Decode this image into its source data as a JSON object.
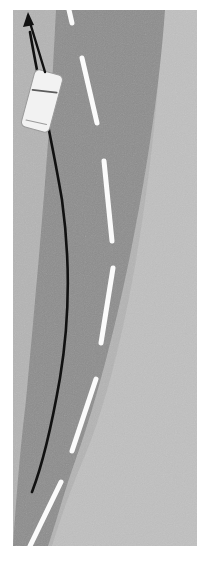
{
  "figure": {
    "name": "overhead-road-scene",
    "canvas": {
      "width": 202,
      "height": 574
    },
    "image_area": {
      "x": 13,
      "y": 10,
      "width": 184,
      "height": 536
    }
  },
  "colors": {
    "page_background": "#ffffff",
    "road_asphalt": "#8d8d8d",
    "shoulder_left": "#b4b4b4",
    "shoulder_right": "#c0c0c0",
    "lane_marking": "#fbfbfb",
    "trajectory": "#111111",
    "arrow": "#111111",
    "car_body": "#f2f2f2",
    "car_outline": "#9a9a9a",
    "car_windshield": "#5c5c5c"
  },
  "scene": {
    "road": {
      "name": "curved-road-surface",
      "lanes": 2,
      "fill": "#8d8d8d",
      "left_edge_path": "M 13 10 L 56 10 C 48 130 36 300 22 420 C 17 470 14 510 13 546 Z",
      "surface_path": "M 56 10 L 165 10 C 156 140 120 340 72 470 C 63 496 55 526 48 546 L 13 546 C 16 500 20 450 26 400 C 38 270 50 140 56 10 Z"
    },
    "shoulders": [
      {
        "name": "left-shoulder",
        "side": "left",
        "fill": "#b4b4b4",
        "path": "M 13 10 L 60 10 C 52 140 38 300 24 420 C 18 472 14 512 13 546 Z"
      },
      {
        "name": "right-shoulder",
        "side": "right",
        "fill": "#c0c0c0",
        "path": "M 163 10 L 197 10 L 197 546 L 52 546 C 62 514 72 486 84 458 C 130 348 157 150 163 10 Z"
      }
    ],
    "lane_markings": {
      "name": "dashed-center-line",
      "style": "dashed",
      "color": "#fbfbfb",
      "width": 5,
      "dashes": [
        {
          "id": "dash-1",
          "x1": 69,
          "y1": 10,
          "x2": 72,
          "y2": 23
        },
        {
          "id": "dash-2",
          "x1": 82,
          "y1": 58,
          "x2": 97,
          "y2": 123
        },
        {
          "id": "dash-3",
          "x1": 104,
          "y1": 161,
          "x2": 112,
          "y2": 241
        },
        {
          "id": "dash-4",
          "x1": 113,
          "y1": 268,
          "x2": 101,
          "y2": 343
        },
        {
          "id": "dash-5",
          "x1": 96,
          "y1": 379,
          "x2": 72,
          "y2": 451
        },
        {
          "id": "dash-6",
          "x1": 61,
          "y1": 482,
          "x2": 30,
          "y2": 546
        }
      ]
    },
    "trajectory": {
      "name": "planned-trajectory-curve",
      "color": "#111111",
      "width": 2.6,
      "path": "M 30 32 C 38 80 52 140 62 200 C 70 258 70 318 60 378 C 52 424 42 466 32 492"
    },
    "heading_arrow": {
      "name": "heading-direction-arrow",
      "color": "#111111",
      "width": 2.4,
      "shaft_path": "M 45 72 L 28 16",
      "head_points": "28,12 23,27 34,25"
    },
    "vehicle": {
      "name": "ego-vehicle-car",
      "type": "car-top-down",
      "body_fill": "#f2f2f2",
      "outline": "#9a9a9a",
      "windshield": "#5c5c5c",
      "center_x": 42,
      "center_y": 101,
      "width": 29,
      "height": 59,
      "rotation_deg": 15,
      "corner_radius": 5
    }
  }
}
